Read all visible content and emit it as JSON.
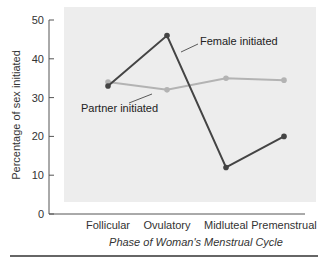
{
  "chart_data": {
    "type": "line",
    "title": "",
    "xlabel": "Phase of Woman's Menstrual Cycle",
    "ylabel": "Percentage of sex initiated",
    "categories": [
      "Follicular",
      "Ovulatory",
      "Midluteal",
      "Premenstrual"
    ],
    "ylim": [
      0,
      50
    ],
    "yticks": [
      0,
      10,
      20,
      30,
      40,
      50
    ],
    "grid": false,
    "legend": "inline annotations",
    "series": [
      {
        "name": "Female initiated",
        "values": [
          33,
          46,
          12,
          20
        ],
        "color": "#444444"
      },
      {
        "name": "Partner initiated",
        "values": [
          34,
          32,
          35,
          34.5
        ],
        "color": "#b3b3b3"
      }
    ],
    "annotations": [
      {
        "text": "Female initiated",
        "series": 0
      },
      {
        "text": "Partner initiated",
        "series": 1
      }
    ]
  },
  "colors": {
    "plot_background": "#ededed",
    "axis": "#555555",
    "bottom_rule": "#666666"
  }
}
